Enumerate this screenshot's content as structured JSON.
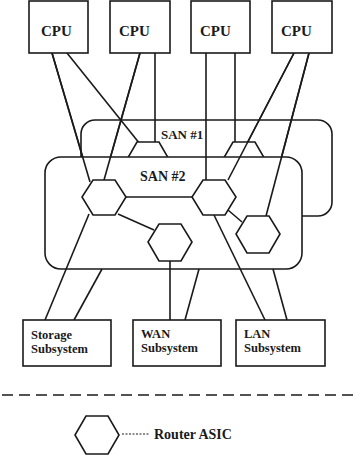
{
  "diagram": {
    "cpus": [
      {
        "label": "CPU"
      },
      {
        "label": "CPU"
      },
      {
        "label": "CPU"
      },
      {
        "label": "CPU"
      }
    ],
    "sans": [
      {
        "label": "SAN #1"
      },
      {
        "label": "SAN #2"
      }
    ],
    "subsystems": [
      {
        "line1": "Storage",
        "line2": "Subsystem"
      },
      {
        "line1": "WAN",
        "line2": "Subsystem"
      },
      {
        "line1": "LAN",
        "line2": "Subsystem"
      }
    ],
    "legend": {
      "label": "Router ASIC",
      "icon": "hexagon-icon"
    },
    "colors": {
      "stroke": "#1a1a1a",
      "background": "#ffffff"
    }
  }
}
